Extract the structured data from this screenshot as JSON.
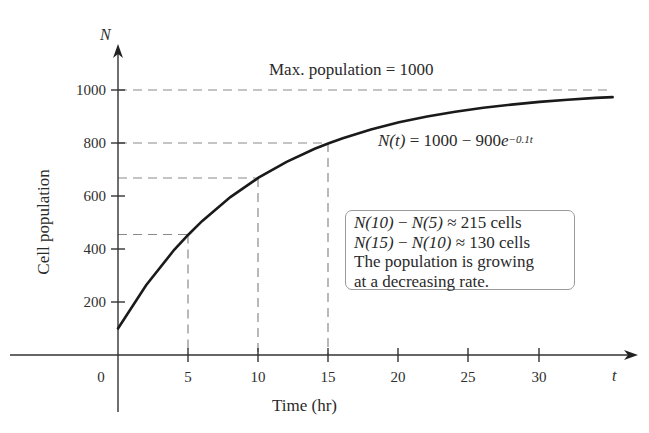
{
  "chart_data": {
    "type": "line",
    "title": "",
    "xlabel": "Time (hr)",
    "ylabel": "Cell population",
    "x_axis_letter": "t",
    "y_axis_letter": "N",
    "xlim": [
      0,
      35
    ],
    "ylim": [
      0,
      1000
    ],
    "x_ticks": [
      0,
      5,
      10,
      15,
      20,
      25,
      30
    ],
    "y_ticks": [
      200,
      400,
      600,
      800,
      1000
    ],
    "grid": false,
    "series": [
      {
        "name": "N(t) = 1000 - 900e^(-0.1t)",
        "x": [
          0,
          2,
          4,
          5,
          6,
          8,
          10,
          12,
          14,
          15,
          16,
          18,
          20,
          22,
          24,
          26,
          28,
          30,
          32,
          34
        ],
        "y": [
          100,
          263,
          397,
          454,
          506,
          596,
          669,
          729,
          778,
          799,
          818,
          851,
          878,
          900,
          918,
          933,
          945,
          955,
          963,
          970
        ]
      }
    ],
    "reference_lines": [
      {
        "type": "horizontal",
        "y": 1000,
        "style": "dashed",
        "label": "Max. population = 1000"
      },
      {
        "type": "guide",
        "x": 5,
        "y": 454,
        "style": "dashed"
      },
      {
        "type": "guide",
        "x": 10,
        "y": 669,
        "style": "dashed"
      },
      {
        "type": "guide",
        "x": 15,
        "y": 799,
        "style": "dashed"
      }
    ],
    "annotations": [
      "Max. population = 1000",
      "N(t) = 1000 − 900e^(−0.1t)",
      "N(10) − N(5) ≈ 215 cells",
      "N(15) − N(10) ≈ 130 cells",
      "The population is growing at a decreasing rate."
    ]
  },
  "labels": {
    "max_label": "Max. population = 1000",
    "eq_lhs": "N(t)",
    "eq_mid": " = 1000 − 900",
    "eq_e": "e",
    "eq_exp": "−0.1t",
    "ylabel": "Cell population",
    "xlabel": "Time (hr)",
    "origin": "0",
    "t_letter": "t",
    "n_letter": "N",
    "x_ticks": [
      "5",
      "10",
      "15",
      "20",
      "25",
      "30"
    ],
    "y_ticks": [
      "200",
      "400",
      "600",
      "800",
      "1000"
    ]
  },
  "note": {
    "line1_a": "N(10)",
    "line1_b": " − ",
    "line1_c": "N(5)",
    "line1_d": " ≈ 215 cells",
    "line2_a": "N(15)",
    "line2_b": " − ",
    "line2_c": "N(10)",
    "line2_d": " ≈ 130 cells",
    "line3": "The population is growing",
    "line4": "at a decreasing rate."
  }
}
